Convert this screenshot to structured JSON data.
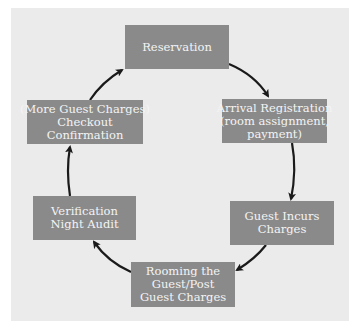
{
  "diagram": {
    "type": "cycle",
    "nodes": [
      {
        "id": "reservation",
        "lines": [
          "Reservation"
        ]
      },
      {
        "id": "arrival",
        "lines": [
          "Arrival Registration",
          "(room assignment,",
          "payment)"
        ]
      },
      {
        "id": "guest-incurs",
        "lines": [
          "Guest Incurs",
          "Charges"
        ]
      },
      {
        "id": "rooming",
        "lines": [
          "Rooming the",
          "Guest/Post",
          "Guest Charges"
        ]
      },
      {
        "id": "verification",
        "lines": [
          "Verification",
          "Night Audit"
        ]
      },
      {
        "id": "checkout",
        "lines": [
          "(More Guest Charges)",
          "Checkout",
          "Confirmation"
        ]
      }
    ],
    "edges": [
      {
        "from": "reservation",
        "to": "arrival"
      },
      {
        "from": "arrival",
        "to": "guest-incurs"
      },
      {
        "from": "guest-incurs",
        "to": "rooming"
      },
      {
        "from": "rooming",
        "to": "verification"
      },
      {
        "from": "verification",
        "to": "checkout"
      },
      {
        "from": "checkout",
        "to": "reservation"
      }
    ],
    "colors": {
      "background": "#ebebeb",
      "box": "#8a8a8a",
      "text": "#f4f4f4",
      "arrow": "#1a1a1a"
    }
  }
}
